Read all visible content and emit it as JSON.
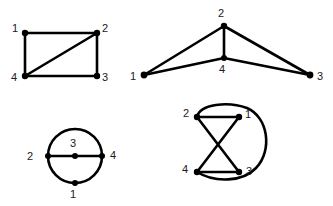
{
  "figure": {
    "background_color": "#ffffff",
    "stroke_color": "#000000",
    "label_color": "#1a1a1a",
    "width": 333,
    "height": 206
  },
  "graphs": [
    {
      "id": "graph-top-left",
      "name": "rectangle-with-diagonal",
      "layout": "rectangle",
      "vertices": [
        {
          "label": "1",
          "x": 25,
          "y": 33,
          "label_x": 15,
          "label_y": 29
        },
        {
          "label": "2",
          "x": 97,
          "y": 33,
          "label_x": 105,
          "label_y": 29
        },
        {
          "label": "3",
          "x": 97,
          "y": 76,
          "label_x": 105,
          "label_y": 78
        },
        {
          "label": "4",
          "x": 25,
          "y": 76,
          "label_x": 14,
          "label_y": 78
        }
      ],
      "edges": [
        {
          "from": "1",
          "to": "2"
        },
        {
          "from": "1",
          "to": "4"
        },
        {
          "from": "2",
          "to": "3"
        },
        {
          "from": "4",
          "to": "3"
        },
        {
          "from": "4",
          "to": "2"
        }
      ]
    },
    {
      "id": "graph-top-right",
      "name": "kite-fan",
      "layout": "fan",
      "vertices": [
        {
          "label": "2",
          "x": 224,
          "y": 26,
          "label_x": 221,
          "label_y": 14
        },
        {
          "label": "1",
          "x": 144,
          "y": 75,
          "label_x": 133,
          "label_y": 77
        },
        {
          "label": "3",
          "x": 310,
          "y": 75,
          "label_x": 319,
          "label_y": 77
        },
        {
          "label": "4",
          "x": 224,
          "y": 58,
          "label_x": 221,
          "label_y": 70
        }
      ],
      "edges": [
        {
          "from": "1",
          "to": "2"
        },
        {
          "from": "2",
          "to": "3"
        },
        {
          "from": "1",
          "to": "4"
        },
        {
          "from": "4",
          "to": "3"
        },
        {
          "from": "2",
          "to": "4"
        }
      ]
    },
    {
      "id": "graph-bottom-left",
      "name": "circle-with-diameter",
      "layout": "circle",
      "circle": {
        "cx": 75,
        "cy": 156,
        "r": 27
      },
      "vertices": [
        {
          "label": "2",
          "x": 48,
          "y": 156,
          "label_x": 30,
          "label_y": 156
        },
        {
          "label": "4",
          "x": 102,
          "y": 156,
          "label_x": 112,
          "label_y": 155
        },
        {
          "label": "3",
          "x": 75,
          "y": 156,
          "label_x": 72,
          "label_y": 143
        },
        {
          "label": "1",
          "x": 75,
          "y": 183,
          "label_x": 72,
          "label_y": 194
        }
      ],
      "edges": [
        {
          "from": "2",
          "to": "3"
        },
        {
          "from": "3",
          "to": "4"
        },
        {
          "from": "2",
          "to": "1",
          "type": "arc"
        },
        {
          "from": "1",
          "to": "4",
          "type": "arc"
        },
        {
          "from": "2",
          "to": "4",
          "type": "arc-over-top"
        }
      ]
    },
    {
      "id": "graph-bottom-right",
      "name": "bowtie-with-outer-arc",
      "layout": "bowtie",
      "vertices": [
        {
          "label": "2",
          "x": 197,
          "y": 117,
          "label_x": 186,
          "label_y": 113
        },
        {
          "label": "1",
          "x": 239,
          "y": 117,
          "label_x": 247,
          "label_y": 114
        },
        {
          "label": "4",
          "x": 197,
          "y": 172,
          "label_x": 185,
          "label_y": 170
        },
        {
          "label": "3",
          "x": 239,
          "y": 172,
          "label_x": 248,
          "label_y": 171
        }
      ],
      "edges": [
        {
          "from": "2",
          "to": "1"
        },
        {
          "from": "4",
          "to": "3"
        },
        {
          "from": "2",
          "to": "3",
          "type": "crossing"
        },
        {
          "from": "1",
          "to": "4",
          "type": "crossing"
        },
        {
          "from": "2",
          "to": "4",
          "type": "outer-arc-right"
        }
      ]
    }
  ]
}
